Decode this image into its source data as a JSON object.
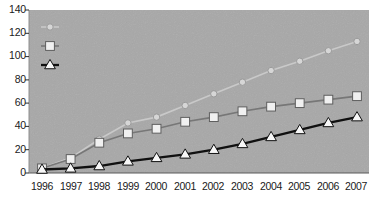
{
  "chart_data": {
    "type": "line",
    "title": "",
    "subtitle": "",
    "xlabel": "",
    "ylabel": "",
    "categories": [
      "1996",
      "1997",
      "1998",
      "1999",
      "2000",
      "2001",
      "2002",
      "2003",
      "2004",
      "2005",
      "2006",
      "2007"
    ],
    "x": [
      1996,
      1997,
      1998,
      1999,
      2000,
      2001,
      2002,
      2003,
      2004,
      2005,
      2006,
      2007
    ],
    "series": [
      {
        "name": "Total",
        "marker": "circle",
        "color": "#d8d8d8",
        "values": [
          4,
          13,
          29,
          43,
          48,
          58,
          68,
          78,
          88,
          96,
          105,
          113
        ]
      },
      {
        "name": "Industrial",
        "marker": "square",
        "color": "#eeeeee",
        "values": [
          4,
          12,
          26,
          34,
          38,
          44,
          48,
          53,
          57,
          60,
          63,
          66
        ]
      },
      {
        "name": "Developing",
        "marker": "triangle",
        "color": "#f5f5f5",
        "values": [
          3,
          4,
          6,
          10,
          13,
          16,
          20,
          25,
          31,
          37,
          43,
          48
        ]
      }
    ],
    "ylim": [
      0,
      140
    ],
    "yticks": [
      0,
      20,
      40,
      60,
      80,
      100,
      120,
      140
    ],
    "ytick_labels": [
      "0",
      "20",
      "40",
      "60",
      "80",
      "100",
      "120",
      "140"
    ],
    "xlim": [
      1996,
      2007
    ],
    "grid": false,
    "legend_position": "top-left",
    "plot_background": "#a8a8a8",
    "figure_background": "#ffffff"
  },
  "legend": {
    "items": [
      {
        "label": "Total"
      },
      {
        "label": "Industrial"
      },
      {
        "label": "Developing"
      }
    ]
  },
  "axes": {
    "y": {
      "ticks": [
        "140",
        "120",
        "100",
        "80",
        "60",
        "40",
        "20",
        "0"
      ]
    },
    "x": {
      "ticks": [
        "1996",
        "1997",
        "1998",
        "1999",
        "2000",
        "2001",
        "2002",
        "2003",
        "2004",
        "2005",
        "2006",
        "2007"
      ]
    }
  }
}
